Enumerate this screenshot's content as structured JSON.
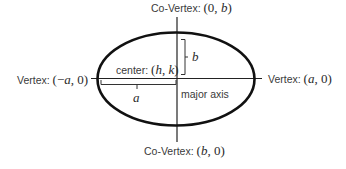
{
  "diagram": {
    "labels": {
      "top_covertex": {
        "text": "Co-Vertex: ",
        "coords": "(0, b)",
        "coord_open": "(0, ",
        "coord_var": "b",
        "coord_close": ")"
      },
      "bottom_covertex": {
        "text": "Co-Vertex: ",
        "coords": "(b, 0)",
        "coord_open": "(",
        "coord_var": "b",
        "coord_close": ", 0)"
      },
      "left_vertex": {
        "text": "Vertex: ",
        "coords": "(−a, 0)",
        "coord_open": "(−",
        "coord_var": "a",
        "coord_close": ", 0)"
      },
      "right_vertex": {
        "text": "Vertex: ",
        "coords": "(a, 0)",
        "coord_open": "(",
        "coord_var": "a",
        "coord_close": ", 0)"
      },
      "center": {
        "text": "center: ",
        "coord_open": "(",
        "var_h": "h",
        "sep": ", ",
        "var_k": "k",
        "coord_close": ")"
      },
      "semi_major": "a",
      "semi_minor": "b",
      "major_axis": "major axis"
    },
    "colors": {
      "ellipse_stroke": "#111111",
      "axis_stroke": "#222222",
      "text": "#3a3a3a"
    }
  }
}
